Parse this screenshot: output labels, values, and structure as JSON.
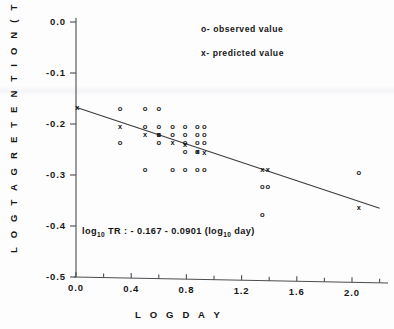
{
  "chart_data": {
    "type": "scatter",
    "title": "",
    "xlabel": "L O G   D A Y",
    "ylabel": "L O G   T A G   R E T E N T I O N ( T R )",
    "xlim": [
      0.0,
      2.2
    ],
    "ylim": [
      -0.5,
      0.02
    ],
    "grid": false,
    "x_ticks": [
      0.0,
      0.4,
      0.8,
      1.2,
      1.6,
      2.0
    ],
    "x_ticklabels": [
      "0.0",
      "0.4",
      "0.8",
      "1.2",
      "1.6",
      "2.0"
    ],
    "x_minor_ticks": [
      0.2,
      0.6,
      1.0,
      1.4,
      1.8,
      2.2
    ],
    "y_ticks": [
      0.0,
      -0.1,
      -0.2,
      -0.3,
      -0.4,
      -0.5
    ],
    "y_ticklabels": [
      "0.0",
      "-0.1",
      "-0.2",
      "-0.3",
      "-0.4",
      "-0.5"
    ],
    "legend_position": "upper-right",
    "legend": [
      {
        "marker": "o",
        "label": "o- observed  value"
      },
      {
        "marker": "x",
        "label": "x- predicted  value"
      }
    ],
    "annotation": {
      "equation_prefix": "log",
      "equation_sub1": "10",
      "equation_mid": " TR : - 0.167 - 0.0901 (log",
      "equation_sub2": "10",
      "equation_suffix": " day)",
      "equation_plain": "log10 TR : -0.167 - 0.0901 (log10 day)"
    },
    "fit": {
      "intercept": -0.167,
      "slope": -0.0901,
      "x_start": 0.0,
      "x_end": 2.2
    },
    "series": [
      {
        "name": "observed value",
        "marker": "o",
        "points": [
          [
            0.32,
            -0.17
          ],
          [
            0.5,
            -0.17
          ],
          [
            0.6,
            -0.17
          ],
          [
            0.32,
            -0.236
          ],
          [
            0.5,
            -0.204
          ],
          [
            0.6,
            -0.204
          ],
          [
            0.7,
            -0.204
          ],
          [
            0.79,
            -0.204
          ],
          [
            0.88,
            -0.204
          ],
          [
            0.93,
            -0.204
          ],
          [
            0.6,
            -0.22
          ],
          [
            0.7,
            -0.22
          ],
          [
            0.79,
            -0.22
          ],
          [
            0.88,
            -0.22
          ],
          [
            0.93,
            -0.22
          ],
          [
            0.6,
            -0.236
          ],
          [
            0.79,
            -0.236
          ],
          [
            0.88,
            -0.236
          ],
          [
            0.93,
            -0.236
          ],
          [
            0.79,
            -0.254
          ],
          [
            0.88,
            -0.254
          ],
          [
            0.5,
            -0.29
          ],
          [
            0.7,
            -0.29
          ],
          [
            0.79,
            -0.29
          ],
          [
            0.88,
            -0.29
          ],
          [
            0.93,
            -0.29
          ],
          [
            1.35,
            -0.322
          ],
          [
            1.39,
            -0.322
          ],
          [
            1.35,
            -0.377
          ],
          [
            2.05,
            -0.295
          ]
        ]
      },
      {
        "name": "predicted value",
        "marker": "x",
        "points": [
          [
            0.01,
            -0.167
          ],
          [
            0.32,
            -0.204
          ],
          [
            0.5,
            -0.22
          ],
          [
            0.6,
            -0.22
          ],
          [
            0.7,
            -0.236
          ],
          [
            0.79,
            -0.24
          ],
          [
            0.88,
            -0.254
          ],
          [
            0.93,
            -0.256
          ],
          [
            1.35,
            -0.29
          ],
          [
            1.39,
            -0.29
          ],
          [
            2.05,
            -0.363
          ]
        ]
      }
    ]
  },
  "axes": {
    "y_axis_name": "log-tag-retention-axis",
    "x_axis_name": "log-day-axis"
  }
}
